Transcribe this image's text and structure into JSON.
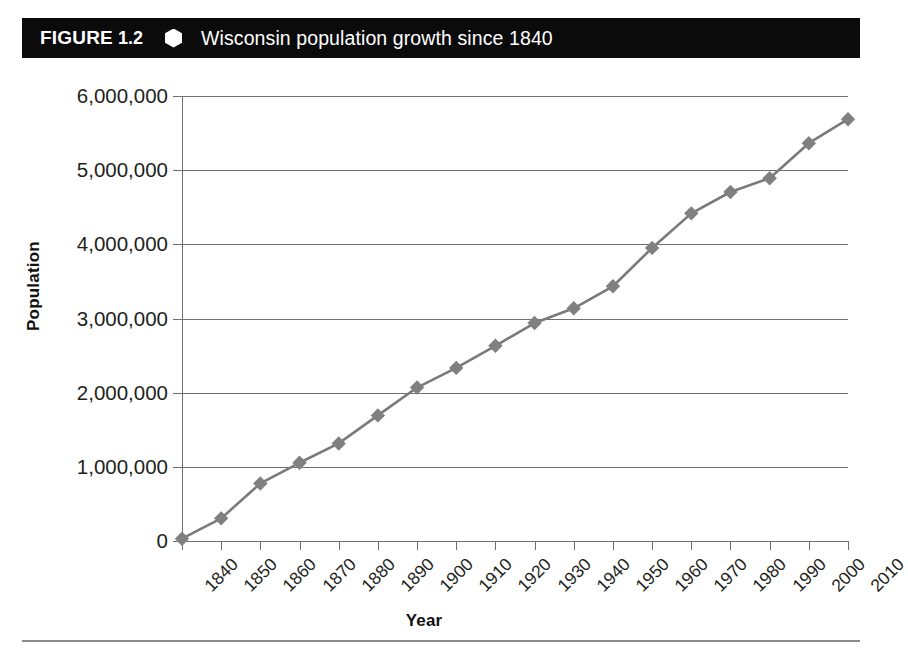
{
  "figure": {
    "label": "FIGURE",
    "number": "1.2",
    "separator_icon": "hexagon-bullet",
    "title": "Wisconsin population growth since 1840"
  },
  "colors": {
    "header_background": "#0b0b0b",
    "header_text": "#ffffff",
    "axis": "#6e6e6e",
    "grid": "#6e6e6e",
    "series_line": "#7a7a7a",
    "series_marker": "#808080",
    "tick_label": "#231f20",
    "footer_rule": "#8a8a8a"
  },
  "chart_data": {
    "type": "line",
    "title": "Wisconsin population growth since 1840",
    "xlabel": "Year",
    "ylabel": "Population",
    "x": [
      1840,
      1850,
      1860,
      1870,
      1880,
      1890,
      1900,
      1910,
      1920,
      1930,
      1940,
      1950,
      1960,
      1970,
      1980,
      1990,
      2000,
      2010
    ],
    "xtick_labels": [
      "1840",
      "1850",
      "1860",
      "1870",
      "1880",
      "1890",
      "1900",
      "1910",
      "1920",
      "1930",
      "1940",
      "1950",
      "1960",
      "1970",
      "1980",
      "1990",
      "2000",
      "2010"
    ],
    "values": [
      30945,
      305391,
      775881,
      1054670,
      1315497,
      1693330,
      2069042,
      2333860,
      2632067,
      2939006,
      3137587,
      3434575,
      3951777,
      4417731,
      4705767,
      4891769,
      5363675,
      5686986
    ],
    "ylim": [
      0,
      6000000
    ],
    "ytick_values": [
      0,
      1000000,
      2000000,
      3000000,
      4000000,
      5000000,
      6000000
    ],
    "ytick_labels": [
      "0",
      "1,000,000",
      "2,000,000",
      "3,000,000",
      "4,000,000",
      "5,000,000",
      "6,000,000"
    ],
    "xlim": [
      1840,
      2010
    ],
    "grid": "horizontal",
    "legend": "none",
    "marker": "diamond"
  }
}
